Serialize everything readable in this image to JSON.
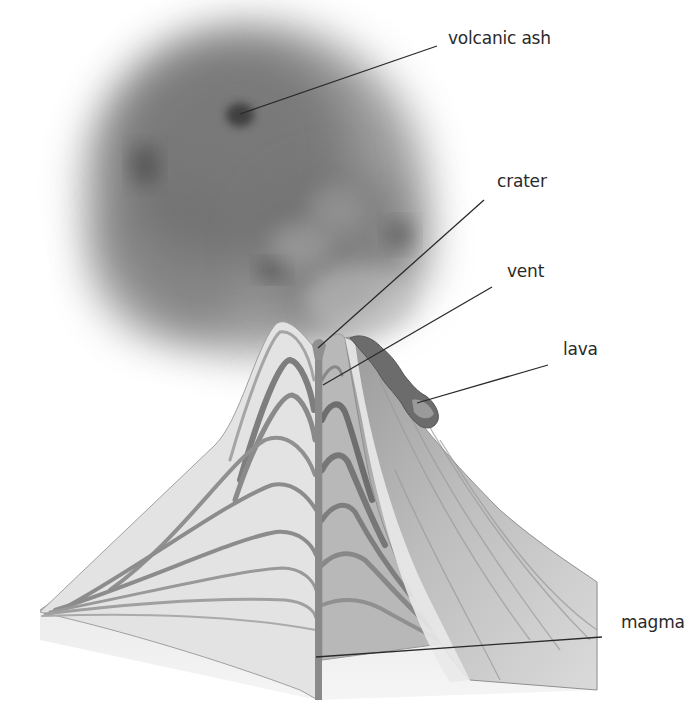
{
  "diagram": {
    "labels": [
      {
        "id": "volcanic-ash",
        "text": "volcanic ash",
        "label_x": 448,
        "label_y": 28,
        "line": [
          437,
          46,
          240,
          114
        ]
      },
      {
        "id": "crater",
        "text": "crater",
        "label_x": 497,
        "label_y": 171,
        "line": [
          484,
          200,
          318,
          348
        ]
      },
      {
        "id": "vent",
        "text": "vent",
        "label_x": 507,
        "label_y": 261,
        "line": [
          492,
          287,
          323,
          385
        ]
      },
      {
        "id": "lava",
        "text": "lava",
        "label_x": 563,
        "label_y": 339,
        "line": [
          548,
          365,
          417,
          403
        ]
      },
      {
        "id": "magma",
        "text": "magma",
        "label_x": 621,
        "label_y": 612,
        "line": [
          602,
          637,
          316,
          657
        ]
      }
    ],
    "colors": {
      "background": "#ffffff",
      "ash": "#5a5a5a",
      "cone_light": "#e4e4e4",
      "cone_mid": "#bdbdbd",
      "layer_band": "#8c8c8c",
      "conduit": "#8a8a8a",
      "lava": "#6e6e6e",
      "leader_line": "#2a2a2a",
      "label_text": "#2a2a2a"
    }
  }
}
